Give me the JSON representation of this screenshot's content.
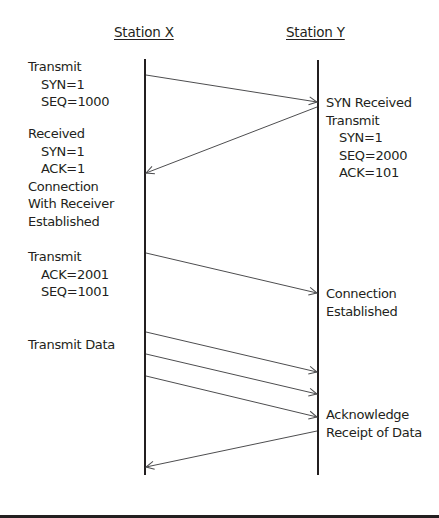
{
  "headers": {
    "station_x": "Station X",
    "station_y": "Station Y"
  },
  "left_labels": [
    {
      "title": "Transmit",
      "lines": [
        "SYN=1",
        "SEQ=1000"
      ]
    },
    {
      "title": "Received",
      "lines": [
        "SYN=1",
        "ACK=1"
      ],
      "extra": [
        "Connection",
        "With Receiver",
        "Established"
      ]
    },
    {
      "title": "Transmit",
      "lines": [
        "ACK=2001",
        "SEQ=1001"
      ]
    },
    {
      "title": "Transmit Data",
      "lines": []
    }
  ],
  "right_labels": [
    {
      "title": "SYN Received",
      "title2": "Transmit",
      "lines": [
        "SYN=1",
        "SEQ=2000",
        "ACK=101"
      ]
    },
    {
      "title": "Connection",
      "title2": "Established",
      "lines": []
    },
    {
      "title": "Acknowledge",
      "title2": "Receipt of Data",
      "lines": []
    }
  ],
  "messages": [
    {
      "from": "X",
      "to": "Y",
      "y1": 75,
      "y2": 102,
      "meaning": "SYN"
    },
    {
      "from": "Y",
      "to": "X",
      "y1": 107,
      "y2": 173,
      "meaning": "SYN-ACK"
    },
    {
      "from": "X",
      "to": "Y",
      "y1": 253,
      "y2": 293,
      "meaning": "ACK"
    },
    {
      "from": "X",
      "to": "Y",
      "y1": 332,
      "y2": 372,
      "meaning": "Data 1"
    },
    {
      "from": "X",
      "to": "Y",
      "y1": 354,
      "y2": 394,
      "meaning": "Data 2"
    },
    {
      "from": "X",
      "to": "Y",
      "y1": 376,
      "y2": 417,
      "meaning": "Data 3"
    },
    {
      "from": "Y",
      "to": "X",
      "y1": 431,
      "y2": 467,
      "meaning": "Acknowledge"
    }
  ],
  "colors": {
    "line": "#231f20",
    "arrow": "#4d4d4f",
    "text": "#231f20"
  }
}
